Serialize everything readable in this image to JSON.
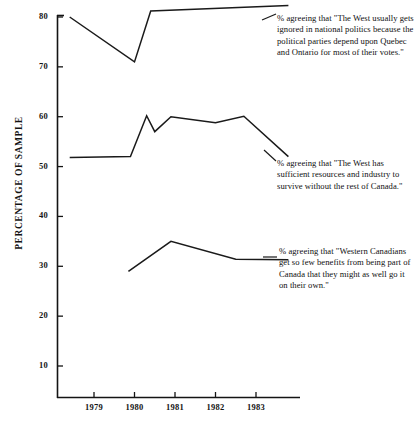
{
  "chart_data": {
    "type": "line",
    "title": "",
    "subtitle": "",
    "xlabel": "",
    "ylabel": "PERCENTAGE OF SAMPLE",
    "x": [
      1979,
      1980,
      1981,
      1982,
      1983
    ],
    "xlim": [
      1978.35,
      1983.85
    ],
    "ylim": [
      0,
      82
    ],
    "yticks": [
      10,
      20,
      30,
      40,
      50,
      60,
      70,
      80
    ],
    "xtick_labels": [
      "1979",
      "1980",
      "1981",
      "1982",
      "1983"
    ],
    "grid": false,
    "legend_position": "inline-right-annotations",
    "line_color": "#1a1a1a",
    "series": [
      {
        "name": "west-ignored",
        "label": "% agreeing that \"The West usually gets ignored in  national politics because the political parties depend upon Quebec and Ontario for most of their votes.\"",
        "points": [
          {
            "x": 1978.4,
            "y": 80.0
          },
          {
            "x": 1980.0,
            "y": 71.0
          },
          {
            "x": 1980.4,
            "y": 81.2
          },
          {
            "x": 1983.8,
            "y": 82.3
          }
        ]
      },
      {
        "name": "sufficient-resources",
        "label": "% agreeing that \"The West has sufficient resources and industry to survive without the rest of Canada.\"",
        "points": [
          {
            "x": 1978.4,
            "y": 51.8
          },
          {
            "x": 1979.9,
            "y": 52.0
          },
          {
            "x": 1980.3,
            "y": 60.2
          },
          {
            "x": 1980.5,
            "y": 57.0
          },
          {
            "x": 1980.9,
            "y": 60.0
          },
          {
            "x": 1982.0,
            "y": 58.8
          },
          {
            "x": 1982.7,
            "y": 60.1
          },
          {
            "x": 1983.8,
            "y": 52.0
          }
        ]
      },
      {
        "name": "go-it-alone",
        "label": "% agreeing that \"Western Canadians get so few benefits from being part of Canada that they might as well go it on their own.\"",
        "points": [
          {
            "x": 1979.85,
            "y": 29.0
          },
          {
            "x": 1980.9,
            "y": 35.0
          },
          {
            "x": 1982.5,
            "y": 31.4
          },
          {
            "x": 1983.8,
            "y": 31.3
          }
        ]
      }
    ]
  },
  "axis": {
    "y_label": "PERCENTAGE OF SAMPLE",
    "y_ticks": [
      {
        "value": "80"
      },
      {
        "value": "70"
      },
      {
        "value": "60"
      },
      {
        "value": "50"
      },
      {
        "value": "40"
      },
      {
        "value": "30"
      },
      {
        "value": "20"
      },
      {
        "value": "10"
      }
    ],
    "x_ticks": [
      {
        "value": "1979"
      },
      {
        "value": "1980"
      },
      {
        "value": "1981"
      },
      {
        "value": "1982"
      },
      {
        "value": "1983"
      }
    ]
  },
  "annotations": [
    {
      "id": "west-ignored-note",
      "text": "% agreeing that \"The West usually gets ignored in  national politics because the political parties depend upon Quebec and Ontario for most of their votes.\""
    },
    {
      "id": "sufficient-resources-note",
      "text": "% agreeing that \"The West has sufficient resources and industry to survive without the rest of Canada.\""
    },
    {
      "id": "go-it-alone-note",
      "text": "% agreeing that \"Western Canadians get so few benefits from being part of Canada that they might as well go it on their own.\""
    }
  ]
}
